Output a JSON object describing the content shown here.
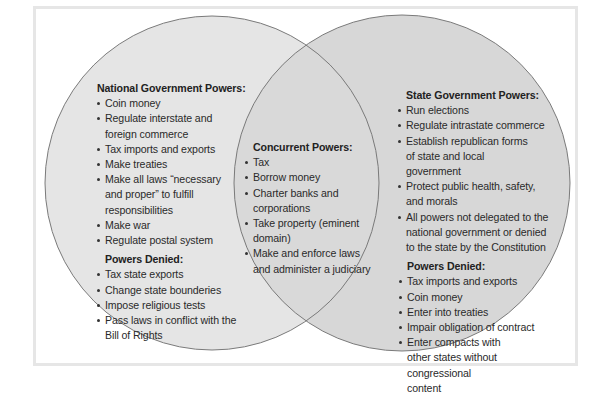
{
  "colors": {
    "left_circle": "#e5e5e5",
    "right_circle": "#d7d7d7",
    "overlap": "#d9d9d9",
    "outline": "#7a7a7a",
    "frame": "#e6e6e6"
  },
  "national": {
    "heading": "National Government Powers:",
    "powers": [
      "Coin money",
      "Regulate interstate and foreign commerce",
      "Tax imports and exports",
      "Make treaties",
      "Make all laws “necessary and proper” to fulfill responsibilities",
      "Make war",
      "Regulate postal system"
    ],
    "denied_heading": "Powers Denied:",
    "denied": [
      "Tax state exports",
      "Change state bounderies",
      "Impose religious tests",
      "Pass laws in conflict with the Bill of Rights"
    ]
  },
  "concurrent": {
    "heading": "Concurrent Powers:",
    "powers": [
      "Tax",
      "Borrow money",
      "Charter banks and corporations",
      "Take property (eminent domain)",
      "Make and enforce laws and administer a judiciary"
    ]
  },
  "state": {
    "heading": "State Government Powers:",
    "powers": [
      "Run elections",
      "Regulate intrastate commerce",
      "Establish republican forms of state and local government",
      "Protect public health, safety, and morals",
      "All powers not delegated to the national government or denied to the state by the Constitution"
    ],
    "denied_heading": "Powers Denied:",
    "denied": [
      "Tax imports and exports",
      "Coin money",
      "Enter into treaties",
      "Impair obligation of contract",
      "Enter compacts with other states without congressional content"
    ]
  }
}
